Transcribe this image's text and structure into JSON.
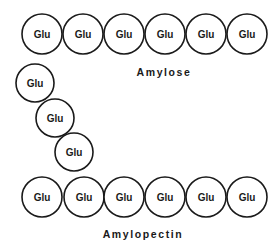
{
  "diagram": {
    "amylose": {
      "label": "Amylose",
      "units": [
        "Glu",
        "Glu",
        "Glu",
        "Glu",
        "Glu",
        "Glu"
      ]
    },
    "amylopectin": {
      "label": "Amylopectin",
      "branch_units": [
        "Glu",
        "Glu",
        "Glu"
      ],
      "main_units": [
        "Glu",
        "Glu",
        "Glu",
        "Glu",
        "Glu",
        "Glu"
      ]
    }
  }
}
